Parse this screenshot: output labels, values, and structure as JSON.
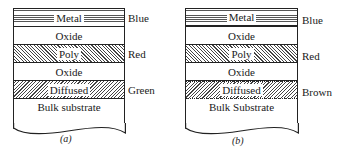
{
  "panels": [
    {
      "caption": "(a)",
      "layers": [
        {
          "name": "Metal",
          "pattern": "horizontal-lines",
          "color_label": "Blue"
        },
        {
          "name": "Oxide",
          "pattern": "none",
          "color_label": ""
        },
        {
          "name": "Poly",
          "pattern": "diagonal-hatch-right",
          "color_label": "Red"
        },
        {
          "name": "Oxide",
          "pattern": "none",
          "color_label": ""
        },
        {
          "name": "Diffused",
          "pattern": "diagonal-hatch-left",
          "color_label": "Green"
        },
        {
          "name": "Bulk substrate",
          "pattern": "none",
          "color_label": ""
        }
      ]
    },
    {
      "caption": "(b)",
      "layers": [
        {
          "name": "Metal",
          "pattern": "horizontal-lines",
          "color_label": "Blue"
        },
        {
          "name": "Oxide",
          "pattern": "none",
          "color_label": ""
        },
        {
          "name": "Poly",
          "pattern": "diagonal-hatch-right",
          "color_label": "Red"
        },
        {
          "name": "Oxide",
          "pattern": "none",
          "color_label": ""
        },
        {
          "name": "Diffused",
          "pattern": "diagonal-hatch-left",
          "color_label": "Brown"
        },
        {
          "name": "Bulk Substrate",
          "pattern": "none",
          "color_label": ""
        }
      ]
    }
  ]
}
